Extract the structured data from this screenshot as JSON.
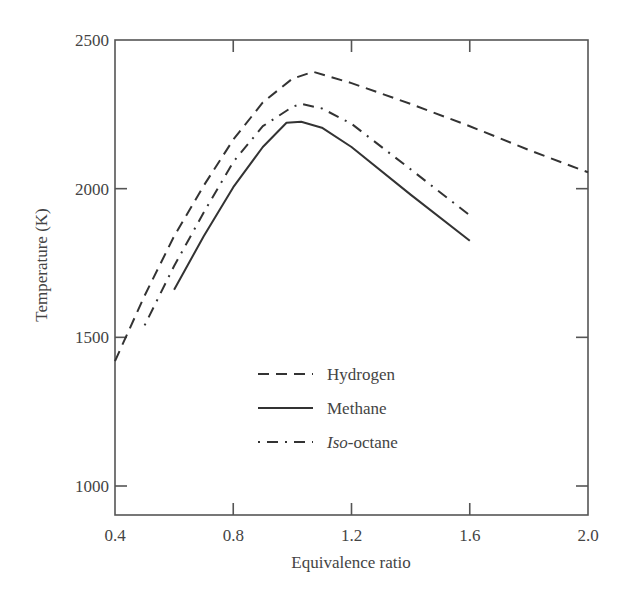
{
  "chart_data": {
    "type": "line",
    "title": "",
    "xlabel": "Equivalence ratio",
    "ylabel": "Temperature (K)",
    "xlim": [
      0.4,
      2.0
    ],
    "ylim": [
      900,
      2500
    ],
    "x_ticks": [
      "0.4",
      "0.8",
      "1.2",
      "1.6",
      "2.0"
    ],
    "y_ticks": [
      "1000",
      "1500",
      "2000",
      "2500"
    ],
    "grid": false,
    "legend_position": "inside-lower-center",
    "series": [
      {
        "name": "Hydrogen",
        "style": "dashed",
        "x": [
          0.4,
          0.5,
          0.6,
          0.7,
          0.8,
          0.9,
          1.0,
          1.07,
          1.2,
          1.4,
          1.6,
          1.8,
          2.0
        ],
        "y": [
          1420,
          1640,
          1840,
          2010,
          2165,
          2290,
          2370,
          2393,
          2355,
          2285,
          2210,
          2130,
          2055
        ]
      },
      {
        "name": "Methane",
        "style": "solid",
        "x": [
          0.6,
          0.7,
          0.8,
          0.9,
          0.98,
          1.03,
          1.1,
          1.2,
          1.4,
          1.6
        ],
        "y": [
          1660,
          1840,
          2005,
          2140,
          2222,
          2225,
          2205,
          2140,
          1980,
          1825
        ]
      },
      {
        "name": "Iso-octane",
        "style": "dash-dot",
        "x": [
          0.5,
          0.6,
          0.7,
          0.8,
          0.9,
          1.0,
          1.03,
          1.1,
          1.2,
          1.4,
          1.6
        ],
        "y": [
          1540,
          1740,
          1920,
          2090,
          2210,
          2275,
          2285,
          2270,
          2218,
          2065,
          1910
        ]
      }
    ]
  },
  "legend": {
    "items": [
      {
        "label": "Hydrogen",
        "style": "dashed"
      },
      {
        "label": "Methane",
        "style": "solid"
      },
      {
        "label_italic": "Iso",
        "label_rest": "-octane",
        "style": "dash-dot"
      }
    ]
  }
}
